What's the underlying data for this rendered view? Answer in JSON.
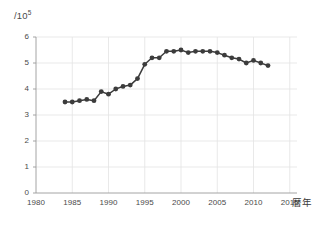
{
  "chart_data": {
    "type": "line",
    "title": "",
    "subtitle": "",
    "xlabel": "暦年",
    "ylabel": "/10⁵",
    "ylabel_base": "/10",
    "ylabel_exponent": "5",
    "xlim": [
      1980,
      2016
    ],
    "ylim": [
      0,
      6
    ],
    "grid": true,
    "legend": "none",
    "marker": "filled-circle",
    "series_color": "#3c3c3c",
    "grid_color": "#e3e3e3",
    "axis_color": "#9a9a9a",
    "xticks": [
      1980,
      1985,
      1990,
      1995,
      2000,
      2005,
      2010,
      2015
    ],
    "xtick_labels": [
      "1980",
      "1985",
      "1990",
      "1995",
      "2000",
      "2005",
      "2010",
      "2015"
    ],
    "yticks": [
      0,
      1,
      2,
      3,
      4,
      5,
      6
    ],
    "ytick_labels": [
      "0",
      "1",
      "2",
      "3",
      "4",
      "5",
      "6"
    ],
    "x": [
      1984,
      1985,
      1986,
      1987,
      1988,
      1989,
      1990,
      1991,
      1992,
      1993,
      1994,
      1995,
      1996,
      1997,
      1998,
      1999,
      2000,
      2001,
      2002,
      2003,
      2004,
      2005,
      2006,
      2007,
      2008,
      2009,
      2010,
      2011,
      2012
    ],
    "values": [
      3.5,
      3.5,
      3.55,
      3.6,
      3.55,
      3.9,
      3.8,
      4.0,
      4.1,
      4.15,
      4.4,
      4.95,
      5.2,
      5.2,
      5.45,
      5.45,
      5.5,
      5.4,
      5.45,
      5.45,
      5.45,
      5.4,
      5.3,
      5.2,
      5.15,
      5.0,
      5.1,
      5.0,
      4.9
    ],
    "series": [
      {
        "name": "series-1",
        "values": [
          3.5,
          3.5,
          3.55,
          3.6,
          3.55,
          3.9,
          3.8,
          4.0,
          4.1,
          4.15,
          4.4,
          4.95,
          5.2,
          5.2,
          5.45,
          5.45,
          5.5,
          5.4,
          5.45,
          5.45,
          5.45,
          5.4,
          5.3,
          5.2,
          5.15,
          5.0,
          5.1,
          5.0,
          4.9
        ]
      }
    ],
    "annotations": []
  }
}
